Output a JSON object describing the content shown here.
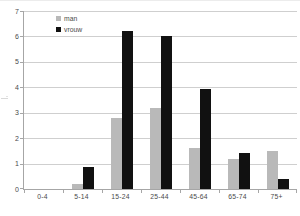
{
  "chart_data": {
    "type": "bar",
    "title": "",
    "categories": [
      "0-4",
      "5-14",
      "15-24",
      "25-44",
      "45-64",
      "65-74",
      "75+"
    ],
    "series": [
      {
        "name": "man",
        "color": "#b9b9b9",
        "values": [
          0,
          0.2,
          2.8,
          3.2,
          1.6,
          1.2,
          1.5
        ]
      },
      {
        "name": "vrouw",
        "color": "#111111",
        "values": [
          0,
          0.85,
          6.2,
          6.0,
          3.95,
          1.4,
          0.4
        ]
      }
    ],
    "xlabel": "",
    "ylabel": "",
    "ylim": [
      0,
      7
    ],
    "yticks": [
      0,
      1,
      2,
      3,
      4,
      5,
      6,
      7
    ],
    "grid": "horizontal",
    "legend_position": "top-left-inside"
  },
  "colors": {
    "background": "#ffffff",
    "gridline": "#cfcfcf",
    "axis": "#a6a6a6",
    "tick_label": "#4a4a4a"
  }
}
